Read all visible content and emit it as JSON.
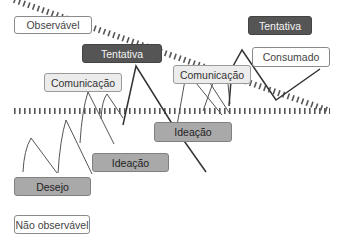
{
  "diagram": {
    "threshold_line": "dotted-separator",
    "labels": {
      "observable": "Observável",
      "not_observable": "Não observável",
      "tentativa_1": "Tentativa",
      "tentativa_2": "Tentativa",
      "comunicacao_1": "Comunicação",
      "comunicacao_2": "Comunicação",
      "consumado": "Consumado",
      "ideacao_1": "Ideação",
      "ideacao_2": "Ideação",
      "desejo": "Desejo"
    },
    "colors": {
      "dark_box": "#555555",
      "mid_box": "#a9a9a9",
      "light_box": "#ececec",
      "line": "#333333"
    }
  }
}
